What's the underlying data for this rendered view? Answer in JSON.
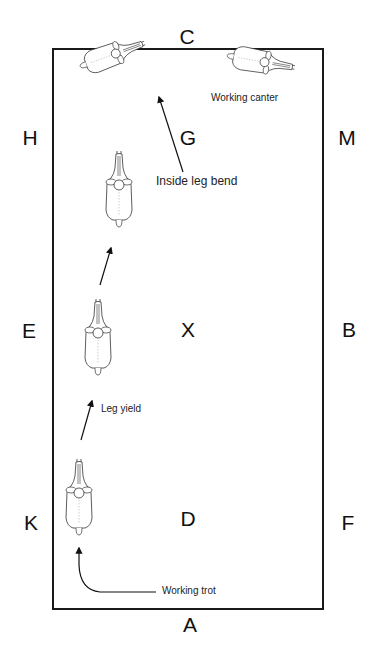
{
  "diagram": {
    "arena_letters": {
      "top": "C",
      "bottom": "A",
      "left_upper": "H",
      "left_middle": "E",
      "left_lower": "K",
      "right_upper": "M",
      "right_middle": "B",
      "right_lower": "F",
      "center_upper": "G",
      "center_middle": "X",
      "center_lower": "D"
    },
    "annotations": {
      "working_canter": "Working canter",
      "inside_leg_bend": "Inside leg bend",
      "leg_yield": "Leg yield",
      "working_trot": "Working trot"
    },
    "colors": {
      "line": "#1a1a1a",
      "background": "#ffffff"
    }
  }
}
